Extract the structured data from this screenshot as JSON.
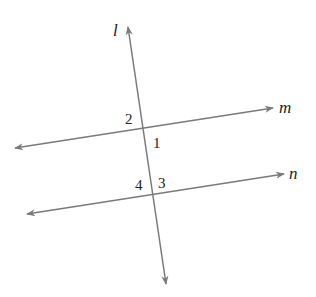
{
  "diagram": {
    "line_color": "#7a7a7a",
    "text_color": "#222222",
    "lines": [
      {
        "name": "l",
        "label": "l",
        "x1": 128,
        "y1": 27,
        "x2": 166,
        "y2": 284,
        "label_x": 113,
        "label_y": 36
      },
      {
        "name": "m",
        "label": "m",
        "x1": 15,
        "y1": 148,
        "x2": 273,
        "y2": 108,
        "label_x": 279,
        "label_y": 113
      },
      {
        "name": "n",
        "label": "n",
        "x1": 27,
        "y1": 214,
        "x2": 284,
        "y2": 174,
        "label_x": 289,
        "label_y": 179
      }
    ],
    "angles": [
      {
        "label": "1",
        "x": 153,
        "y": 148
      },
      {
        "label": "2",
        "x": 125,
        "y": 124
      },
      {
        "label": "3",
        "x": 158,
        "y": 188
      },
      {
        "label": "4",
        "x": 135,
        "y": 190
      }
    ]
  }
}
